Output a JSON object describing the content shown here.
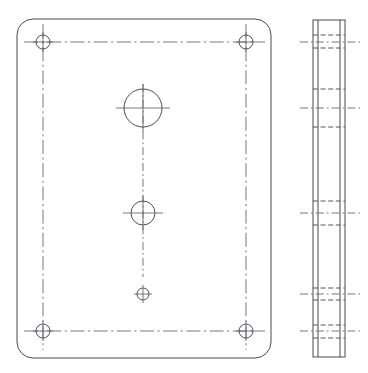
{
  "drawing": {
    "title": "Cover plate engineering drawing",
    "sheet_background": "#ffffff",
    "line_color": "#4a4a52",
    "centerline_color": "#6a6a72",
    "hidden_line_color": "#55555d",
    "views": [
      {
        "id": "front-view",
        "name": "Front view",
        "projection": "front",
        "outline": {
          "shape": "rounded-rectangle",
          "x": 17,
          "y": 19,
          "width": 254,
          "height": 339,
          "corner_radius": 16
        },
        "corner_holes": [
          {
            "id": "corner-hole-top-left",
            "cx": 43,
            "cy": 42,
            "r": 7
          },
          {
            "id": "corner-hole-top-right",
            "cx": 246,
            "cy": 42,
            "r": 7
          },
          {
            "id": "corner-hole-bottom-left",
            "cx": 43,
            "cy": 331,
            "r": 7
          },
          {
            "id": "corner-hole-bottom-right",
            "cx": 246,
            "cy": 331,
            "r": 7
          }
        ],
        "center_holes": [
          {
            "id": "large-center-hole",
            "cx": 143,
            "cy": 108,
            "r": 19
          },
          {
            "id": "medium-center-hole",
            "cx": 143,
            "cy": 213,
            "r": 12
          },
          {
            "id": "small-center-hole",
            "cx": 143,
            "cy": 294,
            "r": 6
          }
        ],
        "center_lines": [
          {
            "id": "vertical-centerline-main",
            "x1": 143,
            "y1": 84,
            "x2": 143,
            "y2": 277
          },
          {
            "id": "horizontal-centerline-top",
            "x1": 24,
            "y1": 42,
            "x2": 265,
            "y2": 42
          },
          {
            "id": "horizontal-centerline-bottom",
            "x1": 24,
            "y1": 331,
            "x2": 265,
            "y2": 331
          },
          {
            "id": "vertical-centerline-left",
            "x1": 43,
            "y1": 24,
            "x2": 43,
            "y2": 350
          },
          {
            "id": "vertical-centerline-right",
            "x1": 246,
            "y1": 24,
            "x2": 246,
            "y2": 350
          },
          {
            "id": "large-hole-horizontal-centerline",
            "x1": 116,
            "y1": 108,
            "x2": 170,
            "y2": 108
          },
          {
            "id": "medium-hole-horizontal-centerline",
            "x1": 123,
            "y1": 213,
            "x2": 163,
            "y2": 213
          }
        ]
      },
      {
        "id": "side-view",
        "name": "Right side view",
        "projection": "right-side",
        "outline": {
          "shape": "rectangle",
          "x": 313,
          "y": 20,
          "width": 32,
          "height": 337
        },
        "hidden_lines": [
          {
            "id": "hidden-line-top-hole-upper",
            "y": 35
          },
          {
            "id": "hidden-line-top-hole-lower",
            "y": 48
          },
          {
            "id": "hidden-line-large-hole-upper",
            "y": 89
          },
          {
            "id": "hidden-line-large-hole-lower",
            "y": 127
          },
          {
            "id": "hidden-line-medium-hole-upper",
            "y": 201
          },
          {
            "id": "hidden-line-medium-hole-lower",
            "y": 225
          },
          {
            "id": "hidden-line-small-hole-upper",
            "y": 288
          },
          {
            "id": "hidden-line-small-hole-lower",
            "y": 300
          },
          {
            "id": "hidden-line-bottom-hole-upper",
            "y": 325
          },
          {
            "id": "hidden-line-bottom-hole-lower",
            "y": 338
          }
        ],
        "center_lines": [
          {
            "id": "side-centerline-top-holes",
            "y": 42
          },
          {
            "id": "side-centerline-large-hole",
            "y": 108
          },
          {
            "id": "side-centerline-medium-hole",
            "y": 213
          },
          {
            "id": "side-centerline-small-hole",
            "y": 294
          },
          {
            "id": "side-centerline-bottom-holes",
            "y": 331
          }
        ],
        "edge_lines": [
          {
            "id": "side-edge-left-inner",
            "x": 318
          },
          {
            "id": "side-edge-right-inner",
            "x": 340
          }
        ]
      }
    ]
  }
}
